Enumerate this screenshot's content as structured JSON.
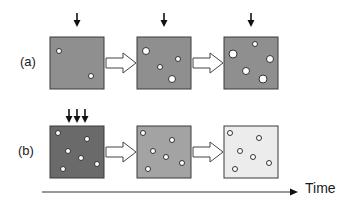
{
  "rows": [
    {
      "label": "(a)",
      "boxes": [
        {
          "fill": "#8f8f8f",
          "input_arrows": 1,
          "particles": [
            {
              "x": 9,
              "y": 14,
              "r": 2.5
            },
            {
              "x": 41,
              "y": 39,
              "r": 2.5
            }
          ]
        },
        {
          "fill": "#8f8f8f",
          "input_arrows": 1,
          "particles": [
            {
              "x": 9,
              "y": 14,
              "r": 3.5
            },
            {
              "x": 23,
              "y": 30,
              "r": 2.5
            },
            {
              "x": 41,
              "y": 22,
              "r": 2.5
            },
            {
              "x": 35,
              "y": 42,
              "r": 3.5
            }
          ]
        },
        {
          "fill": "#8f8f8f",
          "input_arrows": 1,
          "particles": [
            {
              "x": 31,
              "y": 7,
              "r": 2.5
            },
            {
              "x": 9,
              "y": 17,
              "r": 4
            },
            {
              "x": 46,
              "y": 22,
              "r": 3.5
            },
            {
              "x": 22,
              "y": 34,
              "r": 3.5
            },
            {
              "x": 39,
              "y": 42,
              "r": 4
            }
          ]
        }
      ]
    },
    {
      "label": "(b)",
      "boxes": [
        {
          "fill": "#6a6a6a",
          "input_arrows": 3,
          "particles": [
            {
              "x": 8,
              "y": 7,
              "r": 2.5
            },
            {
              "x": 37,
              "y": 13,
              "r": 2.5
            },
            {
              "x": 18,
              "y": 25,
              "r": 2.5
            },
            {
              "x": 31,
              "y": 32,
              "r": 2.5
            },
            {
              "x": 47,
              "y": 38,
              "r": 2.5
            },
            {
              "x": 13,
              "y": 43,
              "r": 2.5
            }
          ]
        },
        {
          "fill": "#a3a3a3",
          "input_arrows": 0,
          "particles": [
            {
              "x": 6,
              "y": 7,
              "r": 2.5
            },
            {
              "x": 35,
              "y": 14,
              "r": 2.5
            },
            {
              "x": 16,
              "y": 25,
              "r": 2.5
            },
            {
              "x": 29,
              "y": 31,
              "r": 2.5
            },
            {
              "x": 45,
              "y": 37,
              "r": 2.5
            },
            {
              "x": 11,
              "y": 43,
              "r": 2.5
            }
          ]
        },
        {
          "fill": "#ececec",
          "input_arrows": 0,
          "particles": [
            {
              "x": 6,
              "y": 7,
              "r": 2.5
            },
            {
              "x": 35,
              "y": 12,
              "r": 2.5
            },
            {
              "x": 16,
              "y": 25,
              "r": 2.5
            },
            {
              "x": 29,
              "y": 31,
              "r": 2.5
            },
            {
              "x": 45,
              "y": 37,
              "r": 2.5
            },
            {
              "x": 11,
              "y": 43,
              "r": 2.5
            }
          ]
        }
      ]
    }
  ],
  "time_axis": {
    "label": "Time"
  },
  "colors": {
    "box_border": "#3a3a3a",
    "particle_fill": "#ffffff",
    "particle_stroke": "#333333",
    "arrow_color": "#111111"
  }
}
